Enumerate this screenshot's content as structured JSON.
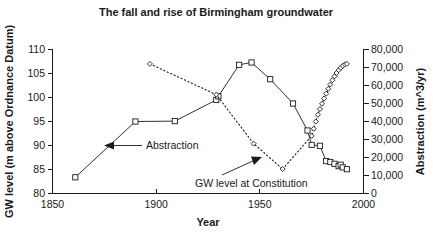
{
  "chart_data": {
    "type": "line",
    "title": "The fall and rise of Birmingham groundwater",
    "xlabel": "Year",
    "ylabel": "GW level (m above Ordnance Datum)",
    "y2label": "Abstraction (m^3/yr)",
    "xlim": [
      1850,
      2000
    ],
    "ylim": [
      80,
      110
    ],
    "y2lim": [
      0,
      80000
    ],
    "grid": false,
    "legend_position": "none",
    "x_ticks": [
      1850,
      1900,
      1950,
      2000
    ],
    "x_tick_labels": [
      "1850",
      "1900",
      "1950",
      "2000"
    ],
    "y_ticks": [
      80,
      85,
      90,
      95,
      100,
      105,
      110
    ],
    "y_tick_labels": [
      "80",
      "85",
      "90",
      "95",
      "100",
      "105",
      "110"
    ],
    "y2_ticks": [
      0,
      10000,
      20000,
      30000,
      40000,
      50000,
      60000,
      70000,
      80000
    ],
    "y2_tick_labels": [
      "0",
      "10,000",
      "20,000",
      "30,000",
      "40,000",
      "50,000",
      "60,000",
      "70,000",
      "80,000"
    ],
    "series": [
      {
        "name": "Abstraction",
        "axis": "right",
        "marker": "square",
        "linestyle": "solid",
        "unit": "m^3/yr",
        "points": [
          {
            "x": 1861,
            "y": 9000
          },
          {
            "x": 1890,
            "y": 40000
          },
          {
            "x": 1909,
            "y": 40200
          },
          {
            "x": 1929,
            "y": 52000
          },
          {
            "x": 1930,
            "y": 54000
          },
          {
            "x": 1940,
            "y": 71500
          },
          {
            "x": 1946,
            "y": 72800
          },
          {
            "x": 1955,
            "y": 63500
          },
          {
            "x": 1966,
            "y": 50000
          },
          {
            "x": 1973,
            "y": 35000
          },
          {
            "x": 1975,
            "y": 27000
          },
          {
            "x": 1979,
            "y": 26500
          },
          {
            "x": 1982,
            "y": 18000
          },
          {
            "x": 1984,
            "y": 17500
          },
          {
            "x": 1986,
            "y": 16500
          },
          {
            "x": 1988,
            "y": 15200
          },
          {
            "x": 1989,
            "y": 16000
          },
          {
            "x": 1990,
            "y": 14500
          },
          {
            "x": 1992,
            "y": 13500
          }
        ]
      },
      {
        "name": "GW level at Constitution",
        "axis": "left",
        "marker": "diamond",
        "linestyle": "dotted",
        "unit": "m above Ordnance Datum",
        "points": [
          {
            "x": 1897,
            "y": 107.0
          },
          {
            "x": 1929,
            "y": 100.6
          },
          {
            "x": 1947,
            "y": 90.4
          },
          {
            "x": 1961,
            "y": 85.1
          },
          {
            "x": 1975,
            "y": 92.0
          },
          {
            "x": 1976,
            "y": 93.5
          },
          {
            "x": 1977,
            "y": 95.0
          },
          {
            "x": 1978,
            "y": 96.4
          },
          {
            "x": 1979,
            "y": 97.6
          },
          {
            "x": 1980,
            "y": 98.7
          },
          {
            "x": 1981,
            "y": 99.8
          },
          {
            "x": 1982,
            "y": 100.8
          },
          {
            "x": 1983,
            "y": 101.8
          },
          {
            "x": 1984,
            "y": 102.7
          },
          {
            "x": 1985,
            "y": 103.6
          },
          {
            "x": 1986,
            "y": 104.4
          },
          {
            "x": 1987,
            "y": 105.1
          },
          {
            "x": 1988,
            "y": 105.7
          },
          {
            "x": 1989,
            "y": 106.2
          },
          {
            "x": 1990,
            "y": 106.6
          },
          {
            "x": 1991,
            "y": 106.9
          },
          {
            "x": 1992,
            "y": 107.0
          }
        ]
      }
    ],
    "annotations": [
      {
        "text": "Abstraction",
        "points_to": "abstraction-series",
        "arrow": "left"
      },
      {
        "text": "GW level at Constitution",
        "points_to": "gw-level-series",
        "arrow": "up-right"
      }
    ]
  },
  "colors": {
    "ink": "#1a1a1a",
    "background": "#ffffff",
    "marker_fill": "#ffffff"
  }
}
